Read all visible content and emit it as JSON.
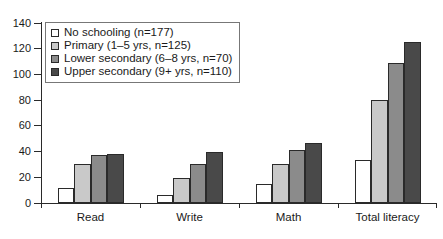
{
  "chart_data": {
    "type": "bar",
    "title": "",
    "xlabel": "",
    "ylabel": "",
    "ylim": [
      0,
      140
    ],
    "yticks": [
      0,
      20,
      40,
      60,
      80,
      100,
      120,
      140
    ],
    "grid": false,
    "legend_position": "top-left",
    "categories": [
      "Read",
      "Write",
      "Math",
      "Total literacy"
    ],
    "series": [
      {
        "name": "No schooling (n=177)",
        "color": "#ffffff",
        "values": [
          12,
          6.5,
          14.5,
          33.5
        ]
      },
      {
        "name": "Primary (1–5 yrs, n=125)",
        "color": "#c9c9c9",
        "values": [
          30,
          19.5,
          30,
          80.5
        ]
      },
      {
        "name": "Lower secondary (6–8 yrs, n=70)",
        "color": "#8b8b8b",
        "values": [
          37,
          30.5,
          41,
          109
        ]
      },
      {
        "name": "Upper secondary (9+ yrs, n=110)",
        "color": "#494949",
        "values": [
          38.5,
          39.5,
          47,
          125
        ]
      }
    ]
  },
  "axis": {
    "tick_labels": [
      "0",
      "20",
      "40",
      "60",
      "80",
      "100",
      "120",
      "140"
    ]
  }
}
